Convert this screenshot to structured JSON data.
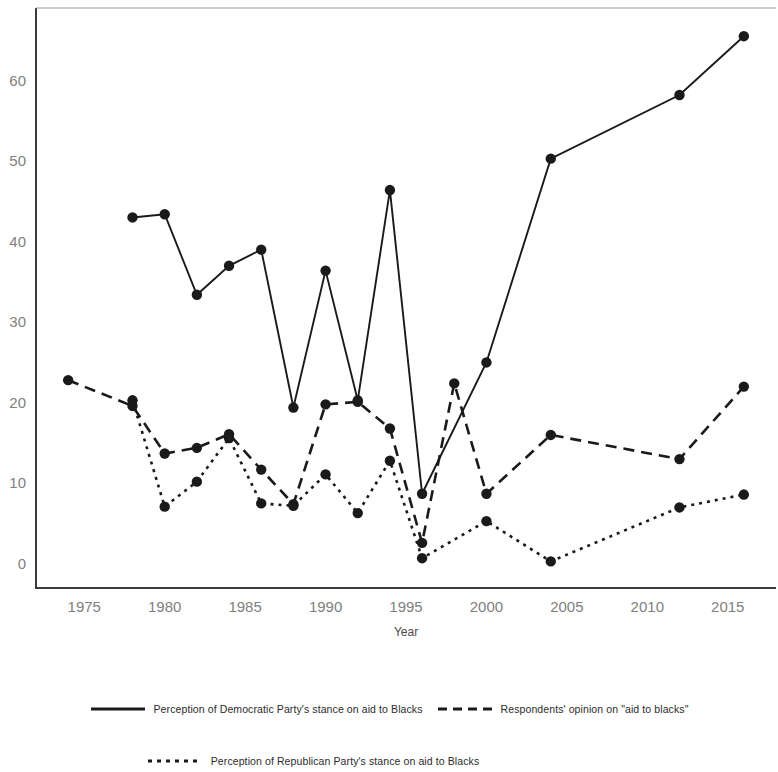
{
  "chart_data": {
    "type": "line",
    "title": "",
    "xlabel": "Year",
    "ylabel": "",
    "xlim": [
      1972,
      2018
    ],
    "ylim": [
      -3,
      69
    ],
    "yticks": [
      0,
      10,
      20,
      30,
      40,
      50,
      60
    ],
    "xticks": [
      1975,
      1980,
      1985,
      1990,
      1995,
      2000,
      2005,
      2010,
      2015
    ],
    "grid": false,
    "legend_position": "bottom",
    "color": "#1a1a1a",
    "series": [
      {
        "name": "Perception of Democratic Party's stance on aid to Blacks",
        "style": "solid",
        "marker": "circle",
        "x": [
          1978,
          1980,
          1982,
          1984,
          1986,
          1988,
          1990,
          1992,
          1994,
          1996,
          2000,
          2004,
          2012,
          2016
        ],
        "y": [
          43.0,
          43.4,
          33.4,
          37.0,
          39.0,
          19.4,
          36.4,
          20.3,
          46.4,
          8.7,
          25.0,
          50.3,
          58.2,
          65.5
        ]
      },
      {
        "name": "Respondents' opinion on \"aid to blacks\"",
        "style": "dashed",
        "marker": "circle",
        "x": [
          1974,
          1978,
          1980,
          1982,
          1984,
          1986,
          1988,
          1990,
          1992,
          1994,
          1996,
          1998,
          2000,
          2004,
          2012,
          2016
        ],
        "y": [
          22.8,
          19.6,
          13.7,
          14.4,
          16.1,
          11.7,
          7.4,
          19.8,
          20.1,
          16.8,
          2.6,
          22.4,
          8.7,
          16.0,
          13.0,
          22.0
        ]
      },
      {
        "name": "Perception of Republican Party's stance on aid to Blacks",
        "style": "dotted",
        "marker": "circle",
        "x": [
          1978,
          1980,
          1982,
          1984,
          1986,
          1988,
          1990,
          1992,
          1994,
          1996,
          2000,
          2004,
          2012,
          2016
        ],
        "y": [
          20.3,
          7.1,
          10.2,
          15.6,
          7.5,
          7.2,
          11.1,
          6.3,
          12.8,
          0.7,
          5.3,
          0.3,
          7.0,
          8.6
        ]
      }
    ]
  },
  "axis": {
    "x_title": "Year",
    "y_tick_labels": [
      "0",
      "10",
      "20",
      "30",
      "40",
      "50",
      "60"
    ],
    "x_tick_labels": [
      "1975",
      "1980",
      "1985",
      "1990",
      "1995",
      "2000",
      "2005",
      "2010",
      "2015"
    ]
  },
  "legend": {
    "entries": [
      {
        "label": "Perception of Democratic Party's stance on aid to Blacks",
        "style": "solid"
      },
      {
        "label": "Respondents' opinion on \"aid to blacks\"",
        "style": "dashed"
      },
      {
        "label": "Perception of Republican Party's stance on aid to Blacks",
        "style": "dotted"
      }
    ]
  }
}
